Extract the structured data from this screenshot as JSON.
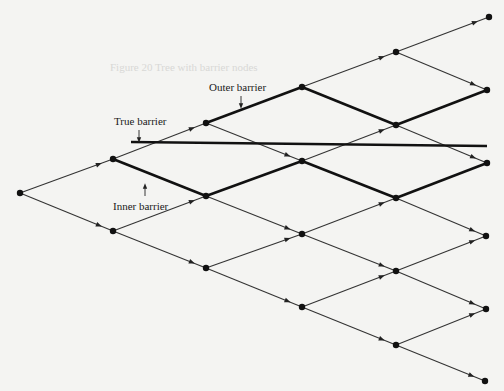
{
  "diagram": {
    "type": "binomial-tree",
    "colors": {
      "background": "#f4f4f2",
      "edge": "#333333",
      "edge_thick": "#111111",
      "node": "#111111",
      "barrier": "#111111"
    },
    "nodes": [
      {
        "id": "n0_0",
        "x": 20,
        "y": 193
      },
      {
        "id": "n1_0",
        "x": 113,
        "y": 159
      },
      {
        "id": "n1_1",
        "x": 113,
        "y": 231
      },
      {
        "id": "n2_0",
        "x": 206,
        "y": 123
      },
      {
        "id": "n2_1",
        "x": 206,
        "y": 196
      },
      {
        "id": "n2_2",
        "x": 206,
        "y": 268
      },
      {
        "id": "n3_0",
        "x": 302,
        "y": 87
      },
      {
        "id": "n3_1",
        "x": 302,
        "y": 161
      },
      {
        "id": "n3_2",
        "x": 302,
        "y": 234
      },
      {
        "id": "n3_3",
        "x": 302,
        "y": 307
      },
      {
        "id": "n4_0",
        "x": 396,
        "y": 52
      },
      {
        "id": "n4_1",
        "x": 396,
        "y": 125
      },
      {
        "id": "n4_2",
        "x": 396,
        "y": 198
      },
      {
        "id": "n4_3",
        "x": 396,
        "y": 271
      },
      {
        "id": "n4_4",
        "x": 396,
        "y": 345
      },
      {
        "id": "n5_0",
        "x": 489,
        "y": 17
      },
      {
        "id": "n5_1",
        "x": 487,
        "y": 90
      },
      {
        "id": "n5_2",
        "x": 487,
        "y": 163
      },
      {
        "id": "n5_3",
        "x": 486,
        "y": 236
      },
      {
        "id": "n5_4",
        "x": 486,
        "y": 309
      },
      {
        "id": "n5_5",
        "x": 485,
        "y": 381
      }
    ],
    "edges": [
      {
        "from": "n0_0",
        "to": "n1_0",
        "thick": false
      },
      {
        "from": "n0_0",
        "to": "n1_1",
        "thick": false
      },
      {
        "from": "n1_0",
        "to": "n2_0",
        "thick": false
      },
      {
        "from": "n1_0",
        "to": "n2_1",
        "thick": true
      },
      {
        "from": "n1_1",
        "to": "n2_1",
        "thick": false
      },
      {
        "from": "n1_1",
        "to": "n2_2",
        "thick": false
      },
      {
        "from": "n2_0",
        "to": "n3_0",
        "thick": true
      },
      {
        "from": "n2_0",
        "to": "n3_1",
        "thick": false
      },
      {
        "from": "n2_1",
        "to": "n3_1",
        "thick": true
      },
      {
        "from": "n2_1",
        "to": "n3_2",
        "thick": false
      },
      {
        "from": "n2_2",
        "to": "n3_2",
        "thick": false
      },
      {
        "from": "n2_2",
        "to": "n3_3",
        "thick": false
      },
      {
        "from": "n3_0",
        "to": "n4_0",
        "thick": false
      },
      {
        "from": "n3_0",
        "to": "n4_1",
        "thick": true
      },
      {
        "from": "n3_1",
        "to": "n4_1",
        "thick": false
      },
      {
        "from": "n3_1",
        "to": "n4_2",
        "thick": true
      },
      {
        "from": "n3_2",
        "to": "n4_2",
        "thick": false
      },
      {
        "from": "n3_2",
        "to": "n4_3",
        "thick": false
      },
      {
        "from": "n3_3",
        "to": "n4_3",
        "thick": false
      },
      {
        "from": "n3_3",
        "to": "n4_4",
        "thick": false
      },
      {
        "from": "n4_0",
        "to": "n5_0",
        "thick": false
      },
      {
        "from": "n4_0",
        "to": "n5_1",
        "thick": false
      },
      {
        "from": "n4_1",
        "to": "n5_1",
        "thick": true
      },
      {
        "from": "n4_1",
        "to": "n5_2",
        "thick": false
      },
      {
        "from": "n4_2",
        "to": "n5_2",
        "thick": true
      },
      {
        "from": "n4_2",
        "to": "n5_3",
        "thick": false
      },
      {
        "from": "n4_3",
        "to": "n5_3",
        "thick": false
      },
      {
        "from": "n4_3",
        "to": "n5_4",
        "thick": false
      },
      {
        "from": "n4_4",
        "to": "n5_4",
        "thick": false
      },
      {
        "from": "n4_4",
        "to": "n5_5",
        "thick": false
      }
    ],
    "true_barrier_line": {
      "x1": 131,
      "y1": 142,
      "x2": 487,
      "y2": 146
    },
    "labels": {
      "outer_barrier": {
        "text": "Outer barrier",
        "x": 209,
        "y": 82,
        "arrow_x": 241,
        "arrow_y1": 96,
        "arrow_y2": 106
      },
      "true_barrier": {
        "text": "True barrier",
        "x": 114,
        "y": 116,
        "arrow_x": 139,
        "arrow_y1": 130,
        "arrow_y2": 140
      },
      "inner_barrier": {
        "text": "Inner barrier",
        "x": 113,
        "y": 201,
        "arrow_x": 145,
        "arrow_y1": 196,
        "arrow_y2": 186
      }
    },
    "caption_ghost": "Figure 20   Tree with barrier nodes"
  }
}
